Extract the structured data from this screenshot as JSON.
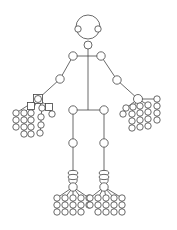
{
  "diagram": {
    "type": "human-skeleton-keypoint-graph",
    "stroke_color": "#444444",
    "background": "#ffffff",
    "head": {
      "cx": 88,
      "cy": 27,
      "r": 12
    },
    "nodes": {
      "left_eye": [
        78,
        29,
        3.2
      ],
      "right_eye": [
        98,
        29,
        3.2
      ],
      "neck": [
        88,
        45,
        4
      ],
      "l_shoulder": [
        73,
        56,
        4.2
      ],
      "r_shoulder": [
        101,
        56,
        4.2
      ],
      "l_elbow": [
        60,
        79,
        4.2
      ],
      "r_elbow": [
        117,
        80,
        4.2
      ],
      "l_hip": [
        73,
        110,
        4.2
      ],
      "r_hip": [
        104,
        110,
        4.2
      ],
      "l_knee": [
        73,
        143,
        4.2
      ],
      "r_knee": [
        104,
        143,
        4.2
      ],
      "l_ankle": [
        73,
        180,
        4.2
      ],
      "r_ankle": [
        104,
        180,
        4.2
      ],
      "l_heel": [
        73,
        173,
        4.5
      ],
      "r_heel": [
        104,
        173,
        4.5
      ]
    },
    "pelvis_y": 110,
    "left_hand": {
      "wrist": [
        38,
        99
      ],
      "wrist_shape": "square",
      "finger_chains": [
        [
          [
            16,
            113
          ],
          [
            16,
            120
          ],
          [
            16,
            127
          ]
        ],
        [
          [
            24,
            113
          ],
          [
            24,
            120
          ],
          [
            24,
            127
          ],
          [
            24,
            134
          ]
        ],
        [
          [
            31,
            113
          ],
          [
            31,
            120
          ],
          [
            31,
            127
          ],
          [
            31,
            134
          ]
        ],
        [
          [
            42,
            108
          ],
          [
            41,
            117
          ],
          [
            41,
            125
          ],
          [
            40,
            133
          ]
        ],
        [
          [
            49,
            107
          ],
          [
            52,
            114
          ]
        ]
      ],
      "extra_squares": [
        [
          31,
          106
        ],
        [
          49,
          107
        ]
      ]
    },
    "right_hand": {
      "wrist": [
        138,
        99
      ],
      "finger_chains": [
        [
          [
            126,
            108
          ],
          [
            123,
            114
          ]
        ],
        [
          [
            133,
            107
          ],
          [
            132,
            114
          ],
          [
            132,
            121
          ],
          [
            132,
            128
          ]
        ],
        [
          [
            140,
            106
          ],
          [
            140,
            113
          ],
          [
            140,
            120
          ],
          [
            140,
            127
          ]
        ],
        [
          [
            148,
            105
          ],
          [
            148,
            112
          ],
          [
            148,
            119
          ],
          [
            148,
            126
          ]
        ],
        [
          [
            157,
            99
          ],
          [
            157,
            106
          ],
          [
            157,
            113
          ],
          [
            157,
            120
          ]
        ]
      ]
    },
    "left_foot": {
      "ankle": [
        73,
        187
      ],
      "toe_chains": [
        [
          [
            57,
            198
          ],
          [
            57,
            205
          ],
          [
            57,
            212
          ]
        ],
        [
          [
            65,
            198
          ],
          [
            65,
            205
          ],
          [
            65,
            212
          ]
        ],
        [
          [
            73,
            198
          ],
          [
            73,
            205
          ],
          [
            73,
            212
          ]
        ],
        [
          [
            81,
            198
          ],
          [
            81,
            205
          ],
          [
            81,
            212
          ]
        ],
        [
          [
            89,
            198
          ],
          [
            89,
            205
          ]
        ]
      ]
    },
    "right_foot": {
      "ankle": [
        104,
        187
      ],
      "toe_chains": [
        [
          [
            90,
            198
          ],
          [
            90,
            205
          ]
        ],
        [
          [
            98,
            198
          ],
          [
            98,
            205
          ],
          [
            98,
            212
          ]
        ],
        [
          [
            106,
            198
          ],
          [
            106,
            205
          ],
          [
            106,
            212
          ]
        ],
        [
          [
            114,
            198
          ],
          [
            114,
            205
          ],
          [
            114,
            212
          ]
        ],
        [
          [
            122,
            198
          ],
          [
            122,
            205
          ],
          [
            122,
            212
          ]
        ]
      ]
    }
  }
}
